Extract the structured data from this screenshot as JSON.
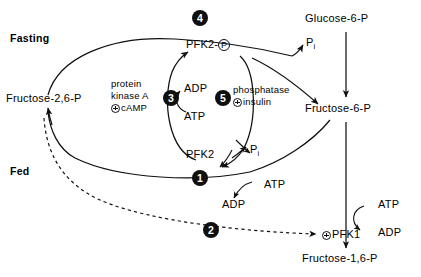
{
  "diagram": {
    "type": "biochemical-pathway",
    "states": {
      "fasting_label": "Fasting",
      "fed_label": "Fed"
    },
    "metabolites": {
      "fructose_26_p": "Fructose-2,6-P",
      "glucose_6_p": "Glucose-6-P",
      "fructose_6_p": "Fructose-6-P",
      "fructose_16_p": "Fructose-1,6-P"
    },
    "enzymes": {
      "pfk2_phospho": "PFK2-",
      "pfk2_phospho_group": "P",
      "pfk2": "PFK2",
      "pfk1": "PFK1",
      "protein_kinase_a": "protein kinase A",
      "protein_kinase_a_line1": "protein",
      "protein_kinase_a_line2": "kinase A",
      "protein_kinase_a_activator": "cAMP",
      "phosphatase": "phosphatase",
      "phosphatase_activator": "insulin"
    },
    "cofactors": {
      "atp": "ATP",
      "adp": "ADP",
      "pi_symbol": "P",
      "pi_subscript": "i"
    },
    "steps": [
      {
        "number": "1",
        "description": "PFK2 dephosphorylated form converts Fructose-6-P to Fructose-2,6-P using ATP"
      },
      {
        "number": "2",
        "description": "Fructose-2,6-P activates PFK1"
      },
      {
        "number": "3",
        "description": "Protein kinase A, activated by cAMP, phosphorylates PFK2 using ATP"
      },
      {
        "number": "4",
        "description": "PFK2-P converts Fructose-2,6-P to Fructose-6-P releasing Pi"
      },
      {
        "number": "5",
        "description": "Phosphatase, activated by insulin, dephosphorylates PFK2-P releasing Pi"
      }
    ],
    "colors": {
      "line": "#101010",
      "badge_fill": "#101010",
      "badge_text": "#ffffff",
      "background": "#ffffff"
    }
  }
}
